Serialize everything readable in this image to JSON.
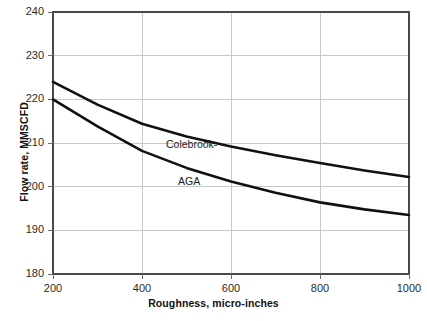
{
  "chart_data": {
    "type": "line",
    "title": "",
    "subtitle": "",
    "xlabel": "Roughness, micro-inches",
    "ylabel": "Flow rate, MMSCFD",
    "xlim": [
      200,
      1000
    ],
    "ylim": [
      180,
      240
    ],
    "x_ticks": [
      200,
      400,
      600,
      800,
      1000
    ],
    "y_ticks": [
      180,
      190,
      200,
      210,
      220,
      230,
      240
    ],
    "grid": "both",
    "grid_color": "#c8c8c8",
    "frame_color": "#3a3a3a",
    "line_color": "#111111",
    "legend": "inline-annotations",
    "x": [
      200,
      300,
      400,
      500,
      600,
      700,
      800,
      900,
      1000
    ],
    "series": [
      {
        "name": "Colebrook-",
        "values": [
          224.0,
          218.8,
          214.4,
          211.5,
          209.2,
          207.2,
          205.4,
          203.7,
          202.2
        ]
      },
      {
        "name": "AGA",
        "values": [
          220.0,
          213.8,
          208.2,
          204.3,
          201.2,
          198.6,
          196.4,
          194.8,
          193.5
        ]
      }
    ],
    "annotations": [
      {
        "text": "Colebrook-",
        "x": 545,
        "y": 211.5
      },
      {
        "text": "AGA",
        "x": 590,
        "y": 203.0
      }
    ]
  },
  "axes": {
    "x_tick_labels": [
      "200",
      "400",
      "600",
      "800",
      "1000"
    ],
    "y_tick_labels": [
      "180",
      "190",
      "200",
      "210",
      "220",
      "230",
      "240"
    ],
    "x_title": "Roughness, micro-inches",
    "y_title": "Flow rate, MMSCFD"
  },
  "annotations": {
    "colebrook_label": "Colebrook-",
    "aga_label": "AGA"
  },
  "colors": {
    "background": "#ffffff",
    "curve": "#111111",
    "grid": "#c8c8c8",
    "frame": "#3a3a3a",
    "text": "#1a1a1a"
  }
}
